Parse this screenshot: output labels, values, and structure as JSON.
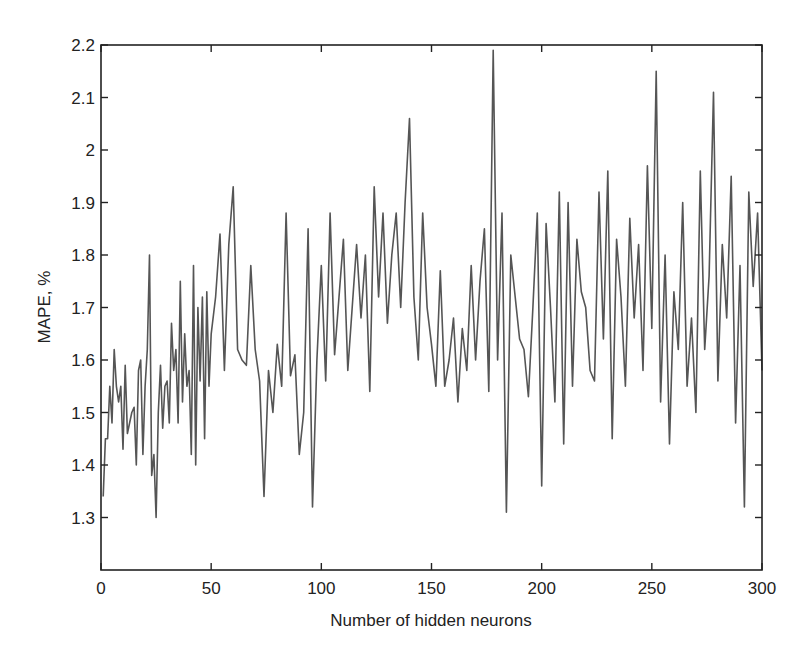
{
  "chart_data": {
    "type": "line",
    "title": "",
    "xlabel": "Number of hidden neurons",
    "ylabel": "MAPE, %",
    "xlim": [
      0,
      300
    ],
    "ylim": [
      1.2,
      2.2
    ],
    "xticks": [
      0,
      50,
      100,
      150,
      200,
      250,
      300
    ],
    "yticks": [
      1.3,
      1.4,
      1.5,
      1.6,
      1.7,
      1.8,
      1.9,
      2.0,
      2.1,
      2.2
    ],
    "ytick_labels": [
      "1.3",
      "1.4",
      "1.5",
      "1.6",
      "1.7",
      "1.8",
      "1.9",
      "2",
      "2.1",
      "2.2"
    ],
    "grid": false,
    "legend": null,
    "line_color": "#555555",
    "series": [
      {
        "name": "MAPE",
        "x": [
          1,
          2,
          3,
          4,
          5,
          6,
          7,
          8,
          9,
          10,
          11,
          12,
          13,
          14,
          15,
          16,
          17,
          18,
          19,
          20,
          21,
          22,
          23,
          24,
          25,
          26,
          27,
          28,
          29,
          30,
          31,
          32,
          33,
          34,
          35,
          36,
          37,
          38,
          39,
          40,
          41,
          42,
          43,
          44,
          45,
          46,
          47,
          48,
          49,
          50,
          52,
          54,
          56,
          58,
          60,
          62,
          64,
          66,
          68,
          70,
          72,
          74,
          76,
          78,
          80,
          82,
          84,
          86,
          88,
          90,
          92,
          94,
          96,
          98,
          100,
          102,
          104,
          106,
          108,
          110,
          112,
          114,
          116,
          118,
          120,
          122,
          124,
          126,
          128,
          130,
          132,
          134,
          136,
          138,
          140,
          142,
          144,
          146,
          148,
          150,
          152,
          154,
          156,
          158,
          160,
          162,
          164,
          166,
          168,
          170,
          172,
          174,
          176,
          178,
          180,
          182,
          184,
          186,
          188,
          190,
          192,
          194,
          196,
          198,
          200,
          202,
          204,
          206,
          208,
          210,
          212,
          214,
          216,
          218,
          220,
          222,
          224,
          226,
          228,
          230,
          232,
          234,
          236,
          238,
          240,
          242,
          244,
          246,
          248,
          250,
          252,
          254,
          256,
          258,
          260,
          262,
          264,
          266,
          268,
          270,
          272,
          274,
          276,
          278,
          280,
          282,
          284,
          286,
          288,
          290,
          292,
          294,
          296,
          298,
          300
        ],
        "values": [
          1.34,
          1.45,
          1.45,
          1.55,
          1.48,
          1.62,
          1.55,
          1.52,
          1.55,
          1.43,
          1.59,
          1.46,
          1.48,
          1.5,
          1.51,
          1.4,
          1.58,
          1.6,
          1.42,
          1.55,
          1.62,
          1.8,
          1.38,
          1.42,
          1.3,
          1.5,
          1.59,
          1.47,
          1.55,
          1.56,
          1.48,
          1.67,
          1.58,
          1.62,
          1.48,
          1.75,
          1.52,
          1.65,
          1.55,
          1.58,
          1.42,
          1.78,
          1.4,
          1.7,
          1.56,
          1.72,
          1.45,
          1.73,
          1.55,
          1.65,
          1.72,
          1.84,
          1.58,
          1.82,
          1.93,
          1.62,
          1.6,
          1.59,
          1.78,
          1.62,
          1.56,
          1.34,
          1.58,
          1.5,
          1.63,
          1.55,
          1.88,
          1.57,
          1.61,
          1.42,
          1.5,
          1.85,
          1.32,
          1.6,
          1.78,
          1.56,
          1.88,
          1.61,
          1.72,
          1.83,
          1.58,
          1.7,
          1.82,
          1.68,
          1.8,
          1.54,
          1.93,
          1.72,
          1.88,
          1.67,
          1.8,
          1.88,
          1.7,
          1.9,
          2.06,
          1.72,
          1.6,
          1.88,
          1.7,
          1.63,
          1.55,
          1.77,
          1.55,
          1.6,
          1.68,
          1.52,
          1.66,
          1.58,
          1.78,
          1.6,
          1.75,
          1.85,
          1.54,
          2.19,
          1.6,
          1.88,
          1.31,
          1.8,
          1.72,
          1.64,
          1.62,
          1.53,
          1.7,
          1.88,
          1.36,
          1.86,
          1.7,
          1.52,
          1.92,
          1.44,
          1.9,
          1.55,
          1.83,
          1.73,
          1.7,
          1.58,
          1.56,
          1.92,
          1.64,
          1.96,
          1.45,
          1.83,
          1.72,
          1.55,
          1.87,
          1.68,
          1.82,
          1.58,
          1.97,
          1.66,
          2.15,
          1.52,
          1.8,
          1.44,
          1.73,
          1.62,
          1.9,
          1.55,
          1.68,
          1.5,
          1.96,
          1.62,
          1.76,
          2.11,
          1.56,
          1.82,
          1.68,
          1.95,
          1.48,
          1.78,
          1.32,
          1.92,
          1.74,
          1.88,
          1.58
        ]
      }
    ]
  }
}
